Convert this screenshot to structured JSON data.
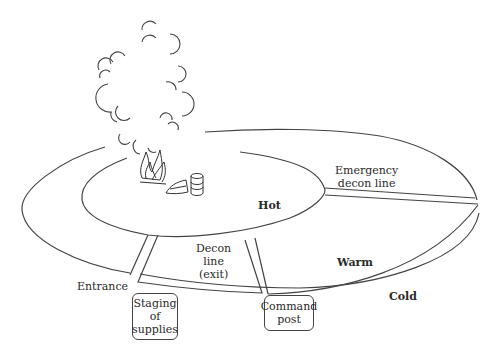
{
  "zones": {
    "hot": "Hot",
    "warm": "Warm",
    "cold": "Cold"
  },
  "labels": {
    "emergency_decon": [
      "Emergency",
      "decon line"
    ],
    "decon_line": [
      "Decon",
      "line",
      "(exit)"
    ],
    "entrance": "Entrance"
  },
  "boxes": {
    "staging": [
      "Staging",
      "of",
      "supplies"
    ],
    "command": [
      "Command",
      "post"
    ]
  },
  "icons": [
    "smoke-cloud-icon",
    "fire-icon",
    "cone-icon",
    "barrel-icon"
  ],
  "colors": {
    "stroke": "#444444",
    "text": "#2a2a2a",
    "background": "#ffffff"
  }
}
